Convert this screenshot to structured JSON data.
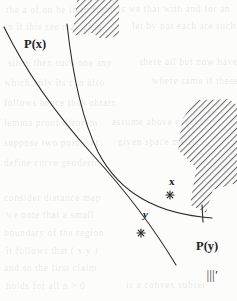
{
  "figure": {
    "kind": "geometric-diagram",
    "background_color": "#fcfcfb",
    "ink_color": "#2b2b2b",
    "hatch_color": "#6d6d72",
    "width": 237,
    "height": 301
  },
  "labels": {
    "p_of_x": "P(x)",
    "p_of_y": "P(y)",
    "point_x": "x",
    "point_y": "y",
    "gamma_prime": "|||'"
  },
  "points": [
    {
      "name": "x",
      "label": "x",
      "cx": 170,
      "cy": 195,
      "marker": "star"
    },
    {
      "name": "y",
      "label": "y",
      "cx": 141,
      "cy": 233,
      "marker": "star"
    }
  ],
  "curves": [
    {
      "name": "curve-p-of-x",
      "label": "P(x)",
      "path": "M 4,27 C 26,72 54,112 92,154 C 124,189 152,225 176,265",
      "stroke_width": 1.1
    },
    {
      "name": "curve-p-of-y",
      "label": "P(y)",
      "path": "M 67,24 C 72,70 80,115 98,152 C 120,194 158,214 212,218",
      "stroke_width": 1.1
    }
  ],
  "hatched_regions": [
    {
      "name": "upper-triangle-region",
      "description": "hatched triangular wedge at top, apex up",
      "polygon": "72,36 77,0 119,0 119,36 101,39 92,33"
    },
    {
      "name": "right-polygon-region",
      "description": "hatched zigzag polygon at right",
      "polygon": "182,119 196,100 229,99 237,105 237,183 213,190 206,213 190,205 196,168 178,150"
    }
  ],
  "tick_marks": [
    {
      "name": "tick-on-upper-curve",
      "x1": 202,
      "y1": 205,
      "x2": 203,
      "y2": 222
    }
  ],
  "bleed_through_lines": [
    {
      "text": "the  a  of  on  be  in  to  from",
      "left": 6,
      "top": 5
    },
    {
      "text": "is  we  that  with  and  for  an",
      "left": 118,
      "top": 4
    },
    {
      "text": "so  it  this  see  may  case",
      "left": 4,
      "top": 22
    },
    {
      "text": "let  by  not  each  are  such",
      "left": 132,
      "top": 21
    },
    {
      "text": "since  then  such  one  any",
      "left": 8,
      "top": 58
    },
    {
      "text": "there  all  but  now  have",
      "left": 140,
      "top": 57
    },
    {
      "text": "which  only  its  can  also",
      "left": 4,
      "top": 78
    },
    {
      "text": "where  same  if  these",
      "left": 152,
      "top": 76
    },
    {
      "text": "follows  hence  thus  obtain",
      "left": 4,
      "top": 98
    },
    {
      "text": "lemma  proof  theorem",
      "left": 4,
      "top": 118
    },
    {
      "text": "assume  above  every",
      "left": 112,
      "top": 117
    },
    {
      "text": "suppose  two  point  set",
      "left": 4,
      "top": 138
    },
    {
      "text": "given  space  metric",
      "left": 118,
      "top": 137
    },
    {
      "text": "define  curve  geodesic",
      "left": 4,
      "top": 158
    },
    {
      "text": "consider  distance  map",
      "left": 4,
      "top": 193
    },
    {
      "text": "we  note  that  a  small",
      "left": 6,
      "top": 210
    },
    {
      "text": "boundary  of  the  region",
      "left": 4,
      "top": 228
    },
    {
      "text": "it  follows  that  (  x  y  )",
      "left": 6,
      "top": 246
    },
    {
      "text": "and  so  the  first  claim",
      "left": 4,
      "top": 263
    },
    {
      "text": "holds  for  all  n  >  0",
      "left": 6,
      "top": 281
    },
    {
      "text": "is  a  convex  subset",
      "left": 126,
      "top": 280
    }
  ]
}
